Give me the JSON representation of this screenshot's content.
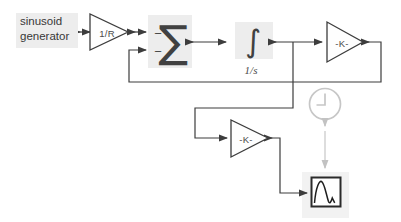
{
  "diagram": {
    "type": "simulink-block-diagram",
    "blocks": {
      "source": {
        "line1": "sinusoid",
        "line2": "generator"
      },
      "gain_1r": {
        "label": "1/R"
      },
      "sum": {
        "symbol": "∑",
        "sign_top": "−",
        "sign_bottom": "−"
      },
      "integrator": {
        "symbol": "∫",
        "label": "1/s"
      },
      "gain_top": {
        "label": "-K-"
      },
      "gain_bottom": {
        "label": "-K-"
      },
      "clock": {
        "icon": "clock-icon",
        "state": "ghosted"
      },
      "scope": {
        "icon": "scope-waveform-icon"
      }
    },
    "colors": {
      "wire": "#3d3d3d",
      "block_background": "#ededed",
      "ghosted": "#c6c6c6",
      "text": "#3a3a3a"
    }
  }
}
